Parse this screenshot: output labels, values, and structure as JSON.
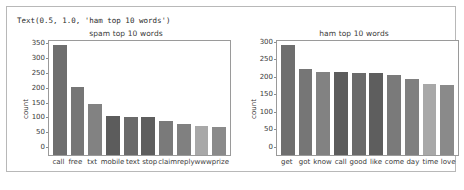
{
  "output": {
    "repr_text": "Text(0.5, 1.0, 'ham top 10 words')"
  },
  "colors": {
    "axis_line": "#9a9a9a",
    "frame": "#b8b8b8",
    "text": "#3a3a3a",
    "background": "#ffffff",
    "bar_palette": [
      "#6e6e6e",
      "#767676",
      "#828282",
      "#5c5c5c",
      "#6a6a6a",
      "#5e5e5e",
      "#7a7a7a",
      "#808080",
      "#a8a8a8",
      "#8a8a8a"
    ]
  },
  "chart_data": [
    {
      "type": "bar",
      "title": "spam top 10 words",
      "xlabel": "",
      "ylabel": "count",
      "categories": [
        "call",
        "free",
        "txt",
        "mobile",
        "text",
        "stop",
        "claim",
        "reply",
        "www",
        "prize"
      ],
      "values": [
        370,
        230,
        172,
        131,
        128,
        127,
        115,
        106,
        98,
        96
      ],
      "yticks": [
        50,
        100,
        150,
        200,
        250,
        300,
        350
      ],
      "ylim": [
        0,
        385
      ],
      "grid": false,
      "legend": "none"
    },
    {
      "type": "bar",
      "title": "ham top 10 words",
      "xlabel": "",
      "ylabel": "count",
      "categories": [
        "get",
        "got",
        "know",
        "call",
        "good",
        "like",
        "come",
        "day",
        "time",
        "love"
      ],
      "values": [
        313,
        245,
        237,
        237,
        234,
        233,
        229,
        216,
        203,
        201
      ],
      "yticks": [
        50,
        100,
        150,
        200,
        250,
        300
      ],
      "ylim": [
        0,
        325
      ],
      "grid": false,
      "legend": "none"
    }
  ]
}
